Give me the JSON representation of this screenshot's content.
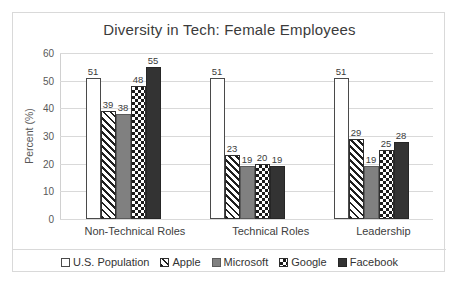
{
  "chart_data": {
    "type": "bar",
    "title": "Diversity in Tech: Female Employees",
    "xlabel": "",
    "ylabel": "Percent (%)",
    "ylim": [
      0,
      60
    ],
    "yticks": [
      0,
      10,
      20,
      30,
      40,
      50,
      60
    ],
    "grid": true,
    "legend_position": "bottom",
    "categories": [
      "Non-Technical Roles",
      "Technical Roles",
      "Leadership"
    ],
    "series": [
      {
        "name": "U.S. Population",
        "values": [
          51,
          51,
          51
        ],
        "pattern": "white",
        "color": "#ffffff"
      },
      {
        "name": "Apple",
        "values": [
          39,
          23,
          29
        ],
        "pattern": "diagonal",
        "color": "#1f1f1f"
      },
      {
        "name": "Microsoft",
        "values": [
          38,
          19,
          19
        ],
        "pattern": "solid-gray",
        "color": "#808080"
      },
      {
        "name": "Google",
        "values": [
          48,
          20,
          25
        ],
        "pattern": "checker",
        "color": "#1b1b1b"
      },
      {
        "name": "Facebook",
        "values": [
          55,
          19,
          28
        ],
        "pattern": "solid-dark",
        "color": "#333333"
      }
    ]
  }
}
